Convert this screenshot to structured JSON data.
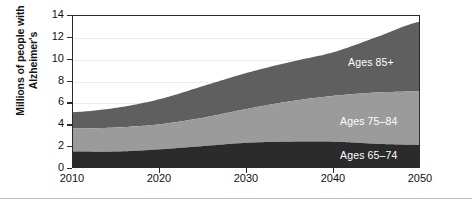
{
  "figure": {
    "ylabel_line1": "Millions of people with",
    "ylabel_line2": "Alzheimer's"
  },
  "series_labels": {
    "older": "Ages 85+",
    "middle": "Ages 75–84",
    "younger": "Ages 65–74"
  },
  "axis": {
    "y_ticks": [
      "0",
      "2",
      "4",
      "6",
      "8",
      "10",
      "12",
      "14"
    ],
    "x_ticks": [
      "2010",
      "2020",
      "2030",
      "2040",
      "2050"
    ]
  },
  "colors": {
    "ages_65_74": "#2b2b2b",
    "ages_75_84": "#9b9b9b",
    "ages_85_plus": "#5f5f5f",
    "frame": "#2a2a2a",
    "gridline": "#ededed",
    "label_text": "#ffffff",
    "background": "#ffffff"
  },
  "chart_data": {
    "type": "area",
    "stacked": true,
    "title": "",
    "xlabel": "",
    "ylabel": "Millions of people with Alzheimer's",
    "xlim": [
      2010,
      2050
    ],
    "ylim": [
      0,
      14
    ],
    "grid": true,
    "legend_position": "inline-labels",
    "x": [
      2010,
      2015,
      2020,
      2025,
      2030,
      2035,
      2040,
      2045,
      2050
    ],
    "series": [
      {
        "name": "Ages 65–74",
        "color": "#2b2b2b",
        "values": [
          1.6,
          1.6,
          1.8,
          2.1,
          2.4,
          2.5,
          2.5,
          2.3,
          2.2
        ]
      },
      {
        "name": "Ages 75–84",
        "color": "#9b9b9b",
        "values": [
          2.1,
          2.2,
          2.3,
          2.6,
          3.1,
          3.7,
          4.2,
          4.7,
          4.9
        ]
      },
      {
        "name": "Ages 85+",
        "color": "#5f5f5f",
        "values": [
          1.5,
          1.8,
          2.3,
          2.9,
          3.3,
          3.6,
          4.0,
          5.1,
          6.4
        ]
      }
    ],
    "totals": [
      5.2,
      5.6,
      6.4,
      7.6,
      8.8,
      9.8,
      10.7,
      12.1,
      13.5
    ]
  }
}
